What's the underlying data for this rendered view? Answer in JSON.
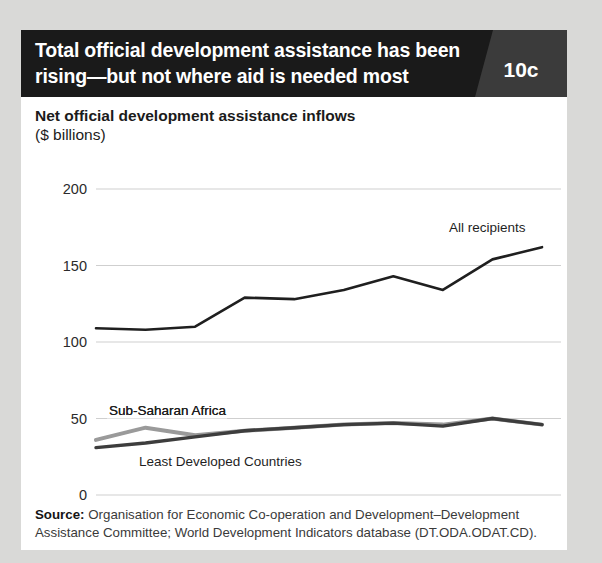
{
  "header": {
    "title": "Total official development assistance has been rising—but not where aid is needed most",
    "badge": "10c"
  },
  "subtitle": {
    "line1": "Net official development assistance inflows",
    "line2": "($ billions)"
  },
  "source": {
    "label": "Source:",
    "text": " Organisation for Economic Co-operation and Development–Development Assistance Committee; World Development Indicators database (DT.ODA.ODAT.CD)."
  },
  "colors": {
    "background": "#d9d9d7",
    "card": "#ffffff",
    "header_bar": "#1a1a1a",
    "badge_panel": "#3b3b3b",
    "all_recipients": "#1f1f1f",
    "least_developed": "#3d3d3d",
    "sub_saharan": "#9a9a9a",
    "gridline": "#cfcfcf"
  },
  "chart_data": {
    "type": "line",
    "title": "Net official development assistance inflows",
    "xlabel": "",
    "ylabel": "($ billions)",
    "ylim": [
      0,
      200
    ],
    "yticks": [
      0,
      50,
      100,
      150,
      200
    ],
    "ytick_labels": [
      "0",
      "50",
      "100",
      "150",
      "200"
    ],
    "grid": true,
    "legend": "inline-labels",
    "x": [
      2005,
      2006,
      2007,
      2008,
      2009,
      2010,
      2011,
      2012,
      2013,
      2014
    ],
    "xtick_labels": [
      "2005",
      "2006",
      "2007",
      "2008",
      "2009",
      "2010",
      "2011",
      "2012",
      "2013",
      "2014"
    ],
    "series": [
      {
        "name": "All recipients",
        "color": "#1f1f1f",
        "values": [
          109,
          108,
          110,
          129,
          128,
          134,
          143,
          134,
          154,
          162
        ]
      },
      {
        "name": "Sub-Saharan Africa",
        "color": "#9a9a9a",
        "values": [
          36,
          44,
          39,
          42,
          44,
          46,
          47,
          46,
          50,
          46
        ]
      },
      {
        "name": "Least Developed Countries",
        "color": "#3d3d3d",
        "values": [
          31,
          34,
          38,
          42,
          44,
          46,
          47,
          45,
          50,
          46
        ]
      }
    ]
  }
}
